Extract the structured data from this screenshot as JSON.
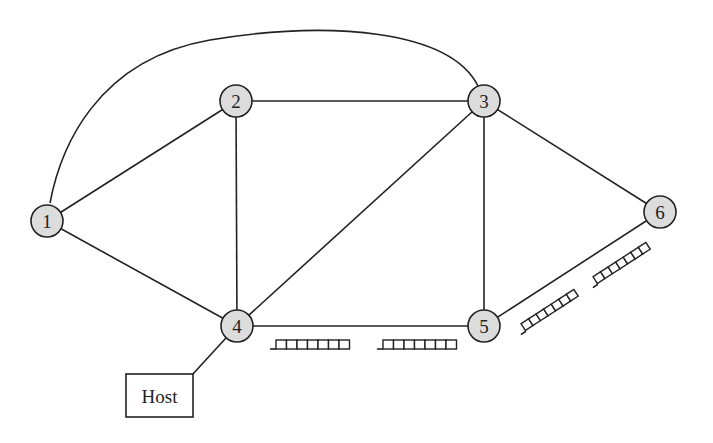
{
  "diagram": {
    "title": "",
    "nodes": [
      {
        "id": "1",
        "label": "1",
        "x": 47,
        "y": 221
      },
      {
        "id": "2",
        "label": "2",
        "x": 236,
        "y": 101
      },
      {
        "id": "3",
        "label": "3",
        "x": 484,
        "y": 101
      },
      {
        "id": "4",
        "label": "4",
        "x": 237,
        "y": 326
      },
      {
        "id": "5",
        "label": "5",
        "x": 484,
        "y": 326
      },
      {
        "id": "6",
        "label": "6",
        "x": 660,
        "y": 212
      }
    ],
    "edges": [
      {
        "from": "1",
        "to": "2"
      },
      {
        "from": "1",
        "to": "4"
      },
      {
        "from": "1",
        "to": "3",
        "curved": true
      },
      {
        "from": "2",
        "to": "3"
      },
      {
        "from": "2",
        "to": "4"
      },
      {
        "from": "3",
        "to": "4"
      },
      {
        "from": "3",
        "to": "5"
      },
      {
        "from": "3",
        "to": "6"
      },
      {
        "from": "4",
        "to": "5"
      },
      {
        "from": "5",
        "to": "6"
      },
      {
        "from": "4",
        "to": "Host"
      }
    ],
    "host": {
      "label": "Host",
      "attached_to": "4"
    },
    "queues": [
      {
        "link": "4-5",
        "direction": "outbound from 4",
        "slots": 7
      },
      {
        "link": "4-5",
        "direction": "outbound from 5",
        "slots": 7
      },
      {
        "link": "5-6",
        "direction": "outbound from 5",
        "slots": 7
      },
      {
        "link": "5-6",
        "direction": "outbound from 6",
        "slots": 7
      }
    ]
  }
}
